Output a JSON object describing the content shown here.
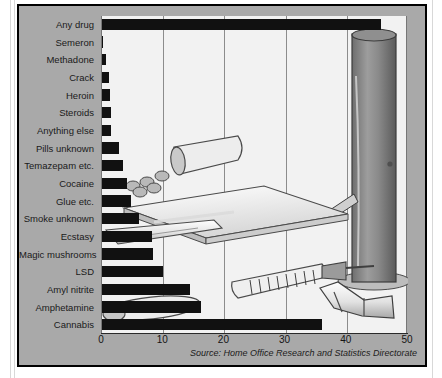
{
  "figure": {
    "background_color": "#a9a9a9",
    "plot_background_color": "#f2f2f2",
    "bar_color": "#111111",
    "source_note": "Source: Home Office Research and Statistics Directorate",
    "illustration_name": "drug-paraphernalia-illustration"
  },
  "chart_data": {
    "type": "bar",
    "orientation": "horizontal",
    "title": "",
    "subtitle": "",
    "xlabel": "",
    "ylabel": "",
    "xlim": [
      0,
      50
    ],
    "ylim": null,
    "grid": true,
    "gridlines_axis": "x",
    "legend": null,
    "legend_position": "none",
    "xticks": [
      "0",
      "10",
      "20",
      "30",
      "40",
      "50"
    ],
    "xtick_values": [
      0,
      10,
      20,
      30,
      40,
      50
    ],
    "categories": [
      "Any drug",
      "Semeron",
      "Methadone",
      "Crack",
      "Heroin",
      "Steroids",
      "Anything else",
      "Pills unknown",
      "Temazepam etc.",
      "Cocaine",
      "Glue etc.",
      "Smoke unknown",
      "Ecstasy",
      "Magic mushrooms",
      "LSD",
      "Amyl nitrite",
      "Amphetamine",
      "Cannabis"
    ],
    "values": [
      45.6,
      0.2,
      0.7,
      1.2,
      1.3,
      1.4,
      1.5,
      2.7,
      3.4,
      4.1,
      4.7,
      6.1,
      8.2,
      8.3,
      9.9,
      14.3,
      16.2,
      36.0
    ],
    "annotations": [
      "Source: Home Office Research and Statistics Directorate"
    ]
  }
}
